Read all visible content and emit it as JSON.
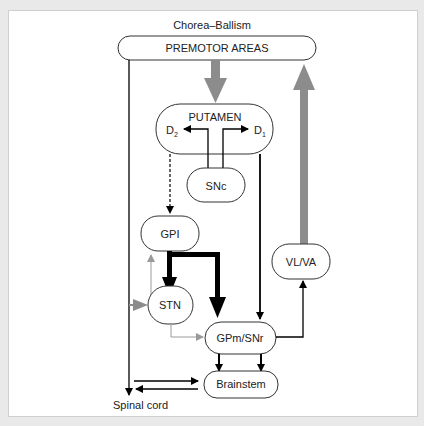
{
  "title": "Chorea–Ballism",
  "nodes": {
    "premotor": "PREMOTOR AREAS",
    "putamen": "PUTAMEN",
    "d2": "D",
    "d2_sub": "2",
    "d1": "D",
    "d1_sub": "1",
    "snc": "SNc",
    "gpi": "GPI",
    "stn": "STN",
    "vlva": "VL/VA",
    "gpm": "GPm/SNr",
    "brainstem": "Brainstem",
    "spinal": "Spinal cord"
  },
  "colors": {
    "gray_arrow": "#8c8c8c",
    "black_arrow": "#000000",
    "light_gray_arrow": "#9a9a9a"
  }
}
